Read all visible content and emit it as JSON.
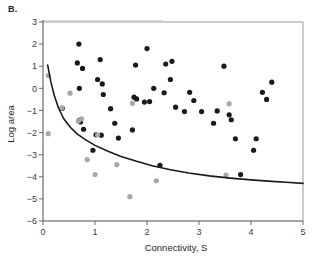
{
  "figure": {
    "panel_label": "B."
  },
  "chart_data": {
    "type": "scatter",
    "title": "",
    "xlabel": "Connectivity, S",
    "ylabel": "Log area",
    "xlim": [
      0,
      5
    ],
    "ylim": [
      -6,
      3
    ],
    "xticks": [
      0,
      1,
      2,
      3,
      4,
      5
    ],
    "xtick_labels": [
      "0",
      "1",
      "2",
      "3",
      "4",
      "5"
    ],
    "yticks": [
      3,
      2,
      1,
      0,
      -1,
      -2,
      -3,
      -4,
      -5,
      -6
    ],
    "ytick_labels": [
      "3",
      "2",
      "1",
      "0",
      "−1",
      "−2",
      "−3",
      "−4",
      "−5",
      "−6"
    ],
    "grid": false,
    "legend": "none",
    "colors": {
      "dark_points": "#1a1a1a",
      "gray_points": "#a8a8a8",
      "curve": "#1a1a1a",
      "frame": "#9a9a9a",
      "frame_tint": "#cfe0d4"
    },
    "series": [
      {
        "name": "dark-points",
        "marker": "filled-circle",
        "color": "#1a1a1a",
        "points": [
          [
            0.37,
            -0.9
          ],
          [
            0.66,
            1.15
          ],
          [
            0.69,
            2.0
          ],
          [
            0.7,
            0.0
          ],
          [
            0.7,
            -1.45
          ],
          [
            0.72,
            -1.52
          ],
          [
            0.76,
            0.9
          ],
          [
            0.78,
            -1.85
          ],
          [
            0.96,
            -2.8
          ],
          [
            1.02,
            -2.1
          ],
          [
            1.05,
            0.4
          ],
          [
            1.1,
            1.3
          ],
          [
            1.12,
            -2.12
          ],
          [
            1.14,
            0.2
          ],
          [
            1.16,
            -0.28
          ],
          [
            1.3,
            -0.92
          ],
          [
            1.38,
            -1.58
          ],
          [
            1.45,
            -2.25
          ],
          [
            1.72,
            -1.88
          ],
          [
            1.75,
            -0.4
          ],
          [
            1.78,
            1.05
          ],
          [
            1.8,
            -0.48
          ],
          [
            1.95,
            -0.62
          ],
          [
            2.0,
            1.8
          ],
          [
            2.05,
            -0.6
          ],
          [
            2.13,
            0.0
          ],
          [
            2.25,
            -3.48
          ],
          [
            2.33,
            -0.2
          ],
          [
            2.36,
            1.1
          ],
          [
            2.45,
            0.4
          ],
          [
            2.48,
            1.22
          ],
          [
            2.55,
            -0.85
          ],
          [
            2.72,
            -1.05
          ],
          [
            2.82,
            -0.18
          ],
          [
            2.9,
            -0.55
          ],
          [
            3.05,
            -1.05
          ],
          [
            3.28,
            -1.58
          ],
          [
            3.35,
            -1.02
          ],
          [
            3.48,
            1.0
          ],
          [
            3.58,
            -1.2
          ],
          [
            3.62,
            -1.42
          ],
          [
            3.7,
            -2.28
          ],
          [
            3.8,
            -3.9
          ],
          [
            4.05,
            -2.8
          ],
          [
            4.1,
            -2.28
          ],
          [
            4.22,
            -0.18
          ],
          [
            4.3,
            -0.5
          ],
          [
            4.4,
            0.28
          ]
        ]
      },
      {
        "name": "gray-points",
        "marker": "filled-circle",
        "color": "#a8a8a8",
        "points": [
          [
            0.1,
            0.58
          ],
          [
            0.1,
            -2.05
          ],
          [
            0.36,
            -0.88
          ],
          [
            0.52,
            -0.22
          ],
          [
            0.68,
            -1.48
          ],
          [
            0.74,
            -1.38
          ],
          [
            0.85,
            -3.22
          ],
          [
            1.0,
            -3.9
          ],
          [
            1.05,
            -2.1
          ],
          [
            1.42,
            -3.45
          ],
          [
            1.67,
            -4.9
          ],
          [
            1.72,
            -0.68
          ],
          [
            2.18,
            -4.18
          ],
          [
            3.52,
            -3.92
          ],
          [
            3.58,
            -0.7
          ]
        ]
      }
    ],
    "fit_curve": {
      "name": "fitted-decay-curve",
      "description": "monotonic decreasing fitted curve",
      "color": "#1a1a1a",
      "points": [
        [
          0.09,
          1.05
        ],
        [
          0.15,
          0.3
        ],
        [
          0.22,
          -0.35
        ],
        [
          0.3,
          -0.9
        ],
        [
          0.4,
          -1.38
        ],
        [
          0.52,
          -1.75
        ],
        [
          0.65,
          -2.05
        ],
        [
          0.8,
          -2.3
        ],
        [
          1.0,
          -2.58
        ],
        [
          1.25,
          -2.85
        ],
        [
          1.5,
          -3.08
        ],
        [
          1.8,
          -3.3
        ],
        [
          2.1,
          -3.5
        ],
        [
          2.45,
          -3.68
        ],
        [
          2.8,
          -3.83
        ],
        [
          3.2,
          -3.96
        ],
        [
          3.6,
          -4.06
        ],
        [
          4.0,
          -4.14
        ],
        [
          4.4,
          -4.21
        ],
        [
          4.75,
          -4.26
        ],
        [
          5.0,
          -4.3
        ]
      ]
    }
  }
}
